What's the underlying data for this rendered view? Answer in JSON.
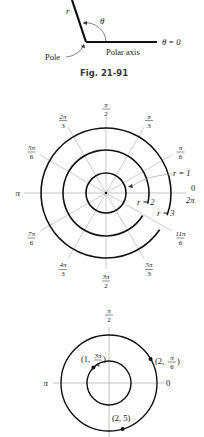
{
  "figure1": {
    "pole": {
      "x": 86,
      "y": 42
    },
    "r_line_end": {
      "x": 72,
      "y": 0
    },
    "axis_end": {
      "x": 157,
      "y": 42
    },
    "labels": {
      "r": "r",
      "theta": "θ",
      "pole": "Pole",
      "polar_axis": "Polar axis",
      "theta_zero": "θ = 0"
    }
  },
  "caption": "Fig. 21-91",
  "figure2": {
    "center": {
      "x": 106,
      "y": 193
    },
    "circles": [
      {
        "r_value": 1,
        "radius": 20
      },
      {
        "r_value": 2,
        "radius": 43
      },
      {
        "r_value": 3,
        "radius": 65
      }
    ],
    "spoke_radius": 76,
    "angle_labels": [
      {
        "num": "π",
        "den": "2",
        "deg": 90
      },
      {
        "num": "π",
        "den": "3",
        "deg": 60
      },
      {
        "num": "π",
        "den": "6",
        "deg": 30
      },
      {
        "num": "2π",
        "den": "3",
        "deg": 120
      },
      {
        "num": "5π",
        "den": "6",
        "deg": 150
      },
      {
        "num": "7π",
        "den": "6",
        "deg": 210
      },
      {
        "num": "4π",
        "den": "3",
        "deg": 240
      },
      {
        "num": "3π",
        "den": "2",
        "deg": 270
      },
      {
        "num": "5π",
        "den": "3",
        "deg": 300
      },
      {
        "num": "11π",
        "den": "6",
        "deg": 330
      }
    ],
    "pi_label": "π",
    "zero_label": "0",
    "two_pi_label": "2π",
    "r_labels": [
      "r = 1",
      "r = 2",
      "r = 3"
    ]
  },
  "figure3": {
    "center": {
      "x": 109,
      "y": 383
    },
    "outer_radius": 48,
    "inner_radius": 22,
    "top_label": {
      "num": "π",
      "den": "2"
    },
    "pi_label": "π",
    "zero_label": "0",
    "points": [
      {
        "label": "(1, 3π/4)",
        "r": 1,
        "theta_deg": 135
      },
      {
        "label": "(2, π/6)",
        "r": 2,
        "theta_deg": 30
      },
      {
        "label": "(2, 5)",
        "r": 2,
        "theta_rad": 5
      }
    ]
  }
}
